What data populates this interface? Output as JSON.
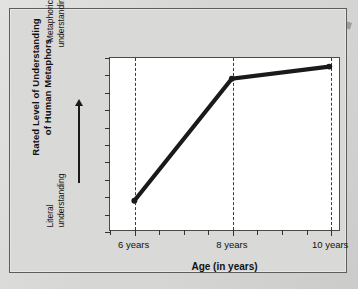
{
  "chart_data": {
    "type": "line",
    "title": "",
    "xlabel": "Age (in years)",
    "ylabel": "Rated Level of Understanding of Human Metaphors",
    "x": [
      6,
      8,
      10
    ],
    "categories": [
      "6 years",
      "8 years",
      "10 years"
    ],
    "values": [
      0.17,
      0.88,
      0.95
    ],
    "xticklabels": [
      "6 years",
      "8 years",
      "10 years"
    ],
    "yticklabels": [],
    "y_axis_anchor_high": "Metaphorical understanding",
    "y_axis_anchor_low": "Literal understanding",
    "xlim": [
      5.5,
      10.2
    ],
    "ylim": [
      0,
      1
    ],
    "grid": "vertical dashed at each labeled age",
    "legend": "none",
    "series": [
      {
        "name": "Rated level of understanding",
        "values": [
          0.17,
          0.88,
          0.95
        ],
        "color": "#1a1a1a",
        "marker": "circle",
        "linewidth": "thick"
      }
    ],
    "annotations": [
      "Upward arrow on y-axis from 'Literal understanding' to 'Metaphorical understanding'"
    ]
  },
  "axes": {
    "y_title_line1": "Rated Level of Understanding",
    "y_title_line2": "of Human Metaphors",
    "y_anchor_high_line1": "Metaphorical",
    "y_anchor_high_line2": "understanding",
    "y_anchor_low_line1": "Literal",
    "y_anchor_low_line2": "understanding",
    "x_title": "Age (in years)",
    "x_tick_1": "6 years",
    "x_tick_2": "8 years",
    "x_tick_3": "10 years"
  },
  "colors": {
    "page_background": "#d6d6d4",
    "panel_background": "#d9d9d7",
    "plot_background": "#ffffff",
    "line": "#1a1a1a",
    "frame": "#4a4a4a",
    "gridline": "#3a3a3a"
  }
}
